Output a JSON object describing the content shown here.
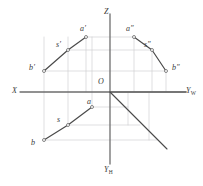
{
  "figure": {
    "background": "#ffffff",
    "width": 203,
    "height": 186
  },
  "colors": {
    "axis": "#6e6e6e",
    "object_line": "#4a4a4a",
    "construction_line": "#c9c9cf",
    "label_text": "#3a3a3a",
    "point_marker_fill": "#ffffff",
    "point_marker_stroke": "#555555"
  },
  "axes": {
    "origin": {
      "label": "O",
      "x": 110,
      "y": 92
    },
    "items": [
      {
        "name": "x-axis",
        "label": "X",
        "label_x": 12,
        "label_y": 87,
        "x1": 20,
        "y1": 92,
        "x2": 186,
        "y2": 92
      },
      {
        "name": "z-axis",
        "label": "Z",
        "label_x": 104,
        "label_y": 8,
        "x1": 110,
        "y1": 14,
        "x2": 110,
        "y2": 92
      },
      {
        "name": "yw-axis",
        "label": "Y",
        "sub": "W",
        "label_x": 186,
        "label_y": 87,
        "x1": 110,
        "y1": 92,
        "x2": 186,
        "y2": 92
      },
      {
        "name": "yh-axis",
        "label": "Y",
        "sub": "H",
        "label_x": 104,
        "label_y": 166,
        "x1": 110,
        "y1": 92,
        "x2": 110,
        "y2": 164
      }
    ],
    "bisector": {
      "name": "forty-five-degree-line",
      "x1": 110,
      "y1": 92,
      "x2": 167,
      "y2": 149
    }
  },
  "views": {
    "front": {
      "name": "front-view",
      "polyline": [
        [
          44,
          71
        ],
        [
          68,
          50
        ],
        [
          86,
          37
        ]
      ],
      "points": [
        {
          "id": "b-prime",
          "label": "b",
          "prime": "′",
          "x": 44,
          "y": 71,
          "label_x": 29,
          "label_y": 64
        },
        {
          "id": "s-prime",
          "label": "s",
          "prime": "′",
          "x": 68,
          "y": 50,
          "label_x": 56,
          "label_y": 41
        },
        {
          "id": "a-prime",
          "label": "a",
          "prime": "′",
          "x": 86,
          "y": 37,
          "label_x": 80,
          "label_y": 25
        }
      ]
    },
    "side": {
      "name": "side-view",
      "polyline": [
        [
          134,
          37
        ],
        [
          152,
          50
        ],
        [
          166,
          71
        ]
      ],
      "points": [
        {
          "id": "a-double-prime",
          "label": "a",
          "prime": "″",
          "x": 134,
          "y": 37,
          "label_x": 126,
          "label_y": 25
        },
        {
          "id": "s-double-prime",
          "label": "s",
          "prime": "″",
          "x": 152,
          "y": 50,
          "label_x": 144,
          "label_y": 41
        },
        {
          "id": "b-double-prime",
          "label": "b",
          "prime": "″",
          "x": 166,
          "y": 71,
          "label_x": 172,
          "label_y": 64
        }
      ]
    },
    "top": {
      "name": "top-view",
      "polyline": [
        [
          44,
          140
        ],
        [
          68,
          125
        ],
        [
          92,
          107
        ]
      ],
      "points": [
        {
          "id": "b",
          "label": "b",
          "prime": "",
          "x": 44,
          "y": 140,
          "label_x": 31,
          "label_y": 139
        },
        {
          "id": "s",
          "label": "s",
          "prime": "",
          "x": 68,
          "y": 125,
          "label_x": 57,
          "label_y": 116
        },
        {
          "id": "a",
          "label": "a",
          "prime": "",
          "x": 92,
          "y": 107,
          "label_x": 87,
          "label_y": 98
        }
      ]
    }
  },
  "construction_lines": {
    "vertical": [
      {
        "name": "construction-v-b",
        "x1": 44,
        "y1": 37,
        "x2": 44,
        "y2": 140
      },
      {
        "name": "construction-v-s",
        "x1": 68,
        "y1": 37,
        "x2": 68,
        "y2": 125
      },
      {
        "name": "construction-v-a",
        "x1": 92,
        "y1": 37,
        "x2": 92,
        "y2": 107
      },
      {
        "name": "construction-v-ap",
        "x1": 86,
        "y1": 37,
        "x2": 86,
        "y2": 92
      },
      {
        "name": "construction-v-as",
        "x1": 134,
        "y1": 37,
        "x2": 134,
        "y2": 92
      },
      {
        "name": "construction-v-ss",
        "x1": 152,
        "y1": 50,
        "x2": 152,
        "y2": 92
      },
      {
        "name": "construction-v-bs",
        "x1": 166,
        "y1": 71,
        "x2": 166,
        "y2": 92
      },
      {
        "name": "construction-v-ab",
        "x1": 128,
        "y1": 92,
        "x2": 128,
        "y2": 125
      },
      {
        "name": "construction-v-bb",
        "x1": 149,
        "y1": 92,
        "x2": 149,
        "y2": 140
      }
    ],
    "horizontal": [
      {
        "name": "construction-h-a",
        "x1": 86,
        "y1": 37,
        "x2": 134,
        "y2": 37
      },
      {
        "name": "construction-h-s",
        "x1": 68,
        "y1": 50,
        "x2": 152,
        "y2": 50
      },
      {
        "name": "construction-h-b",
        "x1": 44,
        "y1": 71,
        "x2": 166,
        "y2": 71
      },
      {
        "name": "construction-h-a-top",
        "x1": 92,
        "y1": 107,
        "x2": 128,
        "y2": 107
      },
      {
        "name": "construction-h-s-top",
        "x1": 68,
        "y1": 125,
        "x2": 140,
        "y2": 125
      },
      {
        "name": "construction-h-b-top",
        "x1": 44,
        "y1": 140,
        "x2": 157,
        "y2": 140
      }
    ]
  }
}
